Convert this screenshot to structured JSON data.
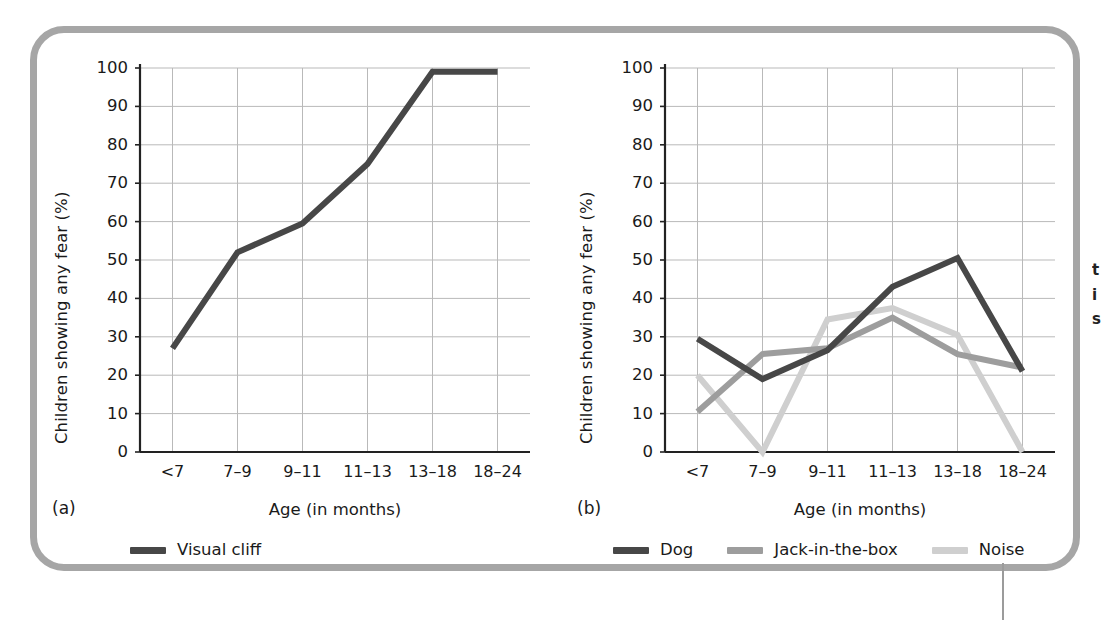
{
  "figure": {
    "frame_color": "#a6a6a6",
    "background": "#ffffff"
  },
  "panels": [
    {
      "letter": "(a)",
      "x_axis_title": "Age (in months)",
      "y_axis_title": "Children showing any fear (%)"
    },
    {
      "letter": "(b)",
      "x_axis_title": "Age (in months)",
      "y_axis_title": "Children showing any fear (%)"
    }
  ],
  "caption_fragment": [
    "t",
    "i",
    "s"
  ],
  "chart_data": [
    {
      "type": "line",
      "title": "",
      "panel": "(a)",
      "xlabel": "Age (in months)",
      "ylabel": "Children showing any fear (%)",
      "categories": [
        "<7",
        "7–9",
        "9–11",
        "11–13",
        "13–18",
        "18–24"
      ],
      "ylim": [
        0,
        100
      ],
      "ytick_labels": [
        "0",
        "10",
        "20",
        "30",
        "40",
        "50",
        "60",
        "70",
        "80",
        "90",
        "100"
      ],
      "ytick_values": [
        0,
        10,
        20,
        30,
        40,
        50,
        60,
        70,
        80,
        90,
        100
      ],
      "grid": true,
      "legend_position": "below-left",
      "series": [
        {
          "name": "Visual cliff",
          "color": "#474747",
          "values": [
            27,
            52,
            59.5,
            75,
            99,
            99
          ]
        }
      ]
    },
    {
      "type": "line",
      "title": "",
      "panel": "(b)",
      "xlabel": "Age (in months)",
      "ylabel": "Children showing any fear (%)",
      "categories": [
        "<7",
        "7–9",
        "9–11",
        "11–13",
        "13–18",
        "18–24"
      ],
      "ylim": [
        0,
        100
      ],
      "ytick_labels": [
        "0",
        "10",
        "20",
        "30",
        "40",
        "50",
        "60",
        "70",
        "80",
        "90",
        "100"
      ],
      "ytick_values": [
        0,
        10,
        20,
        30,
        40,
        50,
        60,
        70,
        80,
        90,
        100
      ],
      "grid": true,
      "legend_position": "below-left",
      "series": [
        {
          "name": "Dog",
          "color": "#474747",
          "values": [
            29.5,
            19,
            26.5,
            43,
            50.5,
            21
          ]
        },
        {
          "name": "Jack-in-the-box",
          "color": "#9d9d9d",
          "values": [
            10.5,
            25.5,
            27,
            35,
            25.5,
            22
          ]
        },
        {
          "name": "Noise",
          "color": "#cfcfcf",
          "values": [
            20,
            0,
            34.5,
            37.5,
            30.5,
            0
          ]
        }
      ]
    }
  ]
}
